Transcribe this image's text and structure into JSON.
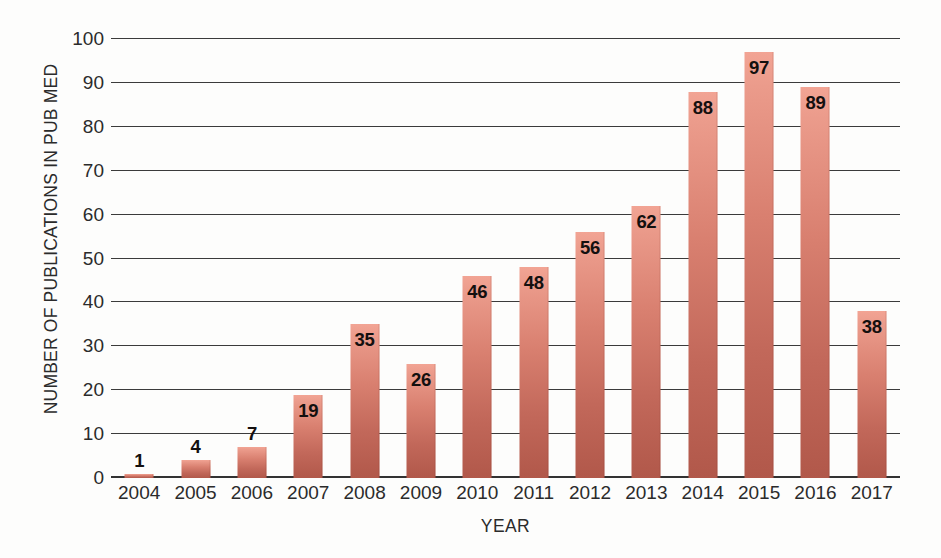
{
  "chart_data": {
    "type": "bar",
    "title": "",
    "subtitle": "",
    "xlabel": "YEAR",
    "ylabel": "NUMBER OF PUBLICATIONS IN PUB MED",
    "categories": [
      "2004",
      "2005",
      "2006",
      "2007",
      "2008",
      "2009",
      "2010",
      "2011",
      "2012",
      "2013",
      "2014",
      "2015",
      "2016",
      "2017"
    ],
    "values": [
      1,
      4,
      7,
      19,
      35,
      26,
      46,
      48,
      56,
      62,
      88,
      97,
      89,
      38
    ],
    "data_labels": [
      "1",
      "4",
      "7",
      "19",
      "35",
      "26",
      "46",
      "48",
      "56",
      "62",
      "88",
      "97",
      "89",
      "38"
    ],
    "ylim": [
      0,
      100
    ],
    "ytick_values": [
      0,
      10,
      20,
      30,
      40,
      50,
      60,
      70,
      80,
      90,
      100
    ],
    "ytick_labels": [
      "0",
      "10",
      "20",
      "30",
      "40",
      "50",
      "60",
      "70",
      "80",
      "90",
      "100"
    ],
    "grid": true,
    "grid_orientation": "horizontal",
    "legend": false,
    "legend_position": "none",
    "annotations": [],
    "series": [
      {
        "name": "Publications in PubMed",
        "values": [
          1,
          4,
          7,
          19,
          35,
          26,
          46,
          48,
          56,
          62,
          88,
          97,
          89,
          38
        ]
      }
    ],
    "colors": {
      "bar_top": "#f2a494",
      "bar_bottom": "#b1584a",
      "gridline": "#3b3b3b",
      "axis": "#323232",
      "text": "#2b2b2b",
      "data_label": "#14100f",
      "background": "#fdfdfc"
    }
  }
}
